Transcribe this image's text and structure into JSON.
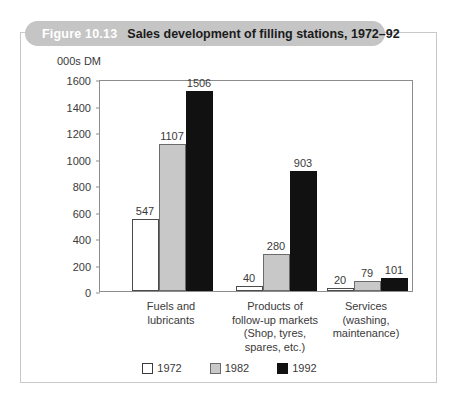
{
  "banner": {
    "figure_number": "Figure 10.13",
    "title": "Sales development of filling stations, 1972–92"
  },
  "chart_data": {
    "type": "bar",
    "title": "Sales development of filling stations, 1972–92",
    "xlabel": "",
    "ylabel": "000s DM",
    "ylim": [
      0,
      1600
    ],
    "yticks": [
      0,
      200,
      400,
      600,
      800,
      1000,
      1200,
      1400,
      1600
    ],
    "ytick_labels": [
      "0",
      "200",
      "400",
      "600",
      "800",
      "1000",
      "1200",
      "1400",
      "1600"
    ],
    "grid": false,
    "legend_position": "bottom-center",
    "categories": [
      "Fuels and\nlubricants",
      "Products of\nfollow-up markets\n(Shop, tyres,\nspares, etc.)",
      "Services\n(washing,\nmaintenance)"
    ],
    "category_lines": [
      [
        "Fuels and",
        "lubricants"
      ],
      [
        "Products of",
        "follow-up markets",
        "(Shop, tyres,",
        "spares, etc.)"
      ],
      [
        "Services",
        "(washing,",
        "maintenance)"
      ]
    ],
    "series": [
      {
        "name": "1972",
        "color": "#ffffff",
        "values": [
          547,
          40,
          20
        ]
      },
      {
        "name": "1982",
        "color": "#c8c8c8",
        "values": [
          1107,
          280,
          79
        ]
      },
      {
        "name": "1992",
        "color": "#111111",
        "values": [
          1506,
          903,
          101
        ]
      }
    ],
    "data_labels": [
      [
        "547",
        "40",
        "20"
      ],
      [
        "1107",
        "280",
        "79"
      ],
      [
        "1506",
        "903",
        "101"
      ]
    ]
  },
  "legend": {
    "items": [
      {
        "label": "1972",
        "swatch": "white"
      },
      {
        "label": "1982",
        "swatch": "gray"
      },
      {
        "label": "1992",
        "swatch": "black"
      }
    ]
  },
  "colors": {
    "banner_background": "#c5c5c5",
    "frame_border": "#c9c9c9",
    "axis": "#8d8d8d",
    "series_1972": "#ffffff",
    "series_1982": "#c8c8c8",
    "series_1992": "#111111",
    "text": "#3a3a3a"
  }
}
